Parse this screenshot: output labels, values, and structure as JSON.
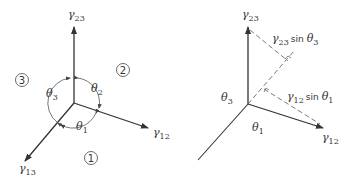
{
  "left_diagram": {
    "axes": {
      "gamma23": {
        "symbol": "γ",
        "sub": "23"
      },
      "gamma12": {
        "symbol": "γ",
        "sub": "12"
      },
      "gamma13": {
        "symbol": "γ",
        "sub": "13"
      }
    },
    "angles": {
      "theta1": {
        "symbol": "θ",
        "sub": "1"
      },
      "theta2": {
        "symbol": "θ",
        "sub": "2"
      },
      "theta3": {
        "symbol": "θ",
        "sub": "3"
      }
    },
    "regions": [
      "1",
      "2",
      "3"
    ]
  },
  "right_diagram": {
    "axes": {
      "gamma23": {
        "symbol": "γ",
        "sub": "23"
      },
      "gamma12": {
        "symbol": "γ",
        "sub": "12"
      }
    },
    "angles": {
      "theta1": {
        "symbol": "θ",
        "sub": "1"
      },
      "theta3": {
        "symbol": "θ",
        "sub": "3"
      }
    },
    "projections": {
      "p23": {
        "symbol": "γ",
        "sub": "23",
        "fn": "sin",
        "angle": "θ",
        "angle_sub": "3"
      },
      "p12": {
        "symbol": "γ",
        "sub": "12",
        "fn": "sin",
        "angle": "θ",
        "angle_sub": "1"
      }
    }
  }
}
